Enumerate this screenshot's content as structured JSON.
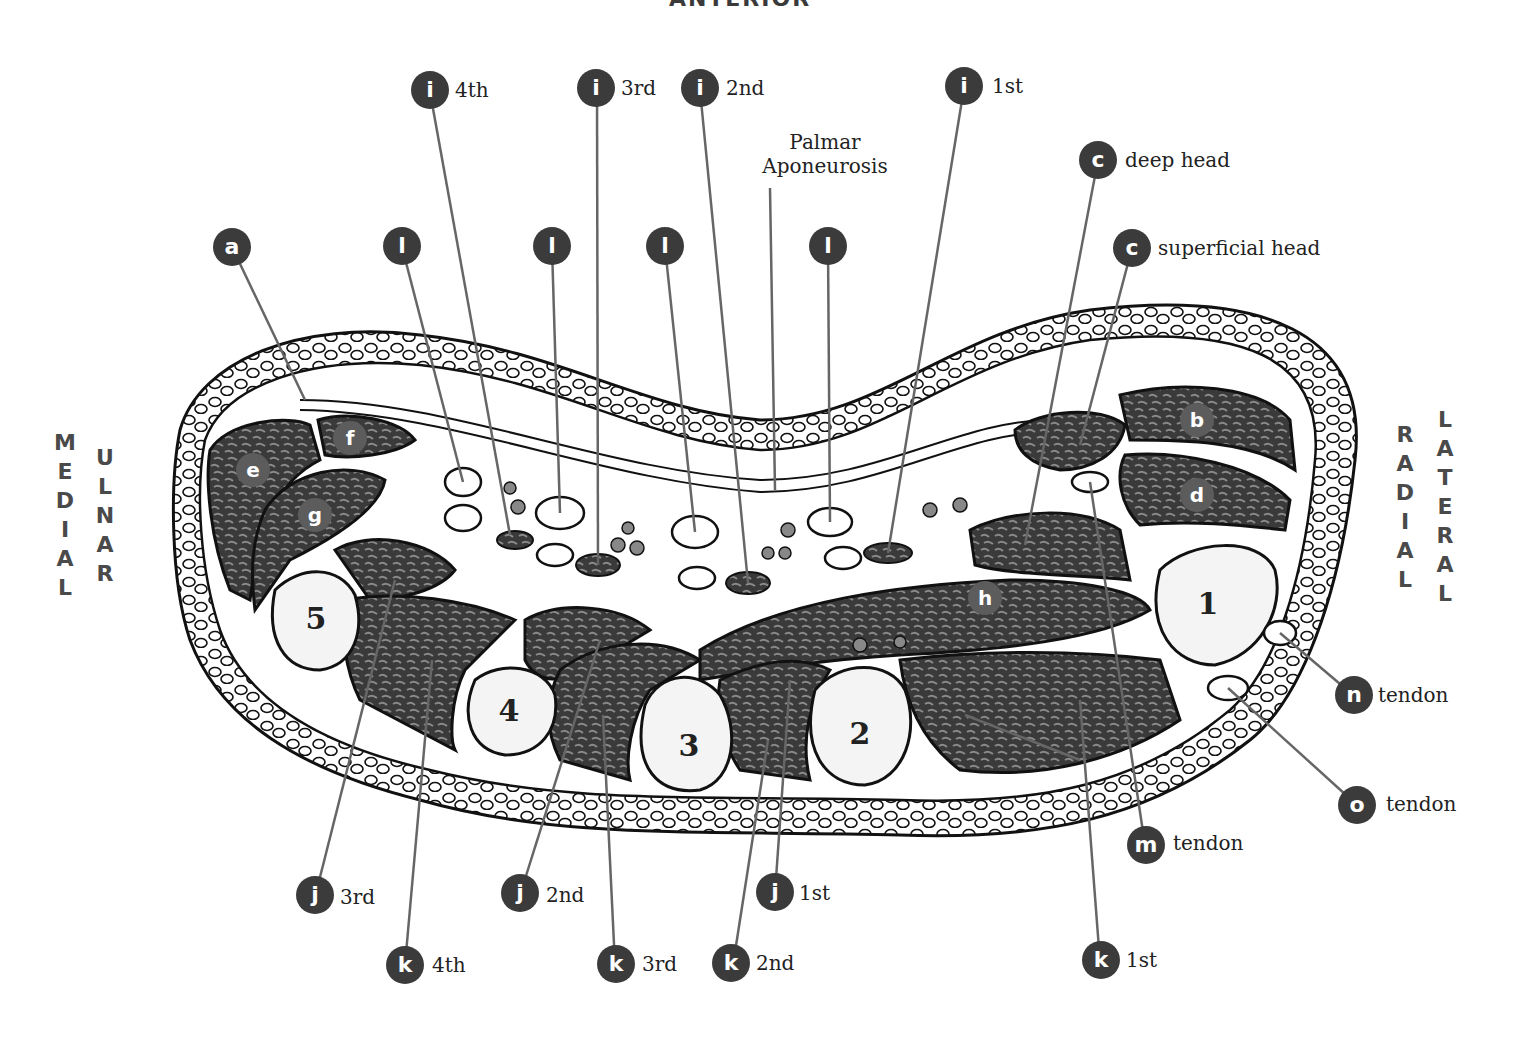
{
  "title": "ANTERIOR",
  "orientation": {
    "left_outer": "MEDIAL",
    "left_inner": "ULNAR",
    "right_inner": "RADIAL",
    "right_outer": "LATERAL"
  },
  "palmar_aponeurosis": {
    "line1": "Palmar",
    "line2": "Aponeurosis"
  },
  "labels": [
    {
      "id": "a",
      "letter": "a",
      "text": ""
    },
    {
      "id": "b",
      "letter": "b",
      "text": ""
    },
    {
      "id": "c_deep",
      "letter": "c",
      "text": "deep head"
    },
    {
      "id": "c_sup",
      "letter": "c",
      "text": "superficial head"
    },
    {
      "id": "d",
      "letter": "d",
      "text": ""
    },
    {
      "id": "e",
      "letter": "e",
      "text": ""
    },
    {
      "id": "f",
      "letter": "f",
      "text": ""
    },
    {
      "id": "g",
      "letter": "g",
      "text": ""
    },
    {
      "id": "h",
      "letter": "h",
      "text": ""
    },
    {
      "id": "i4",
      "letter": "i",
      "text": "4th"
    },
    {
      "id": "i3",
      "letter": "i",
      "text": "3rd"
    },
    {
      "id": "i2",
      "letter": "i",
      "text": "2nd"
    },
    {
      "id": "i1",
      "letter": "i",
      "text": "1st"
    },
    {
      "id": "j3",
      "letter": "j",
      "text": "3rd"
    },
    {
      "id": "j2",
      "letter": "j",
      "text": "2nd"
    },
    {
      "id": "j1",
      "letter": "j",
      "text": "1st"
    },
    {
      "id": "k4",
      "letter": "k",
      "text": "4th"
    },
    {
      "id": "k3",
      "letter": "k",
      "text": "3rd"
    },
    {
      "id": "k2",
      "letter": "k",
      "text": "2nd"
    },
    {
      "id": "k1",
      "letter": "k",
      "text": "1st"
    },
    {
      "id": "l1",
      "letter": "l",
      "text": ""
    },
    {
      "id": "l2",
      "letter": "l",
      "text": ""
    },
    {
      "id": "l3",
      "letter": "l",
      "text": ""
    },
    {
      "id": "l4",
      "letter": "l",
      "text": ""
    },
    {
      "id": "m",
      "letter": "m",
      "text": "tendon"
    },
    {
      "id": "n",
      "letter": "n",
      "text": "tendon"
    },
    {
      "id": "o",
      "letter": "o",
      "text": "tendon"
    }
  ],
  "metacarpals": [
    "1",
    "2",
    "3",
    "4",
    "5"
  ],
  "colors": {
    "badge": "#3b3b3b",
    "muscle": "#3a3a3a",
    "bone": "#f4f4f4",
    "outline": "#111111",
    "leader": "#666666"
  }
}
